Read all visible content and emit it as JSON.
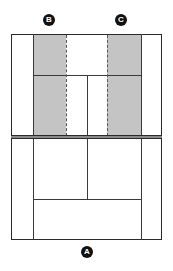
{
  "diagram": {
    "type": "tennis-court-top-view",
    "labels": {
      "a": "A",
      "b": "B",
      "c": "C"
    },
    "colors": {
      "shaded_zone": "#c4c4c4",
      "lines": "#2a2a2a",
      "badge": "#111111"
    }
  }
}
